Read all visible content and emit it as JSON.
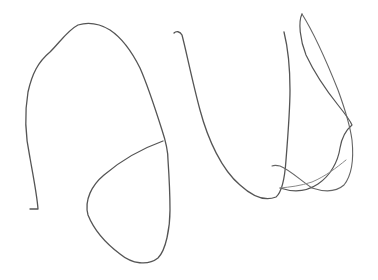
{
  "image": {
    "kind": "hand-drawn sketch",
    "background_color": "#ffffff",
    "stroke_color": "#555555",
    "light_stroke_color": "#8a8a8a",
    "width": 378,
    "height": 280
  },
  "strokes": [
    {
      "name": "left-arch-stroke",
      "description": "large rounded arch on the left descending into a hook at bottom-left"
    },
    {
      "name": "left-loop-stroke",
      "description": "rounded teardrop loop below the arch, joined at its right side"
    },
    {
      "name": "middle-u-stroke",
      "description": "U-shaped curve from small hook at top center down and up again"
    },
    {
      "name": "right-tall-loop-stroke",
      "description": "narrow tall loop on the right with a crossing tail at the bottom"
    }
  ]
}
